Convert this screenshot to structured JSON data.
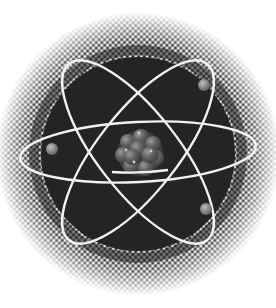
{
  "image": {
    "subject": "Atom illustration",
    "description": "Halftone atom icon with nucleus and three orbiting electrons",
    "colors": {
      "background": "#ffffff",
      "disc": "#242424",
      "halftone_dot": "#1c1c1c",
      "orbit": "#f2f2f2",
      "nucleus_base": "#5a5a5a",
      "nucleus_highlight": "#8a8a8a",
      "electron": "#8c8c8c",
      "electron_highlight": "#bdbdbd"
    },
    "center": [
      138,
      154
    ],
    "disc_radius": 96,
    "halftone_outer_radius": 142,
    "orbits": [
      {
        "name": "orbit-horizontal",
        "rx": 118,
        "ry": 32,
        "rotate": -3
      },
      {
        "name": "orbit-tilted-left",
        "rx": 110,
        "ry": 42,
        "rotate": 52
      },
      {
        "name": "orbit-tilted-right",
        "rx": 110,
        "ry": 42,
        "rotate": -52
      }
    ],
    "electrons": [
      {
        "name": "electron-top-right",
        "cx": 204,
        "cy": 85,
        "r": 6
      },
      {
        "name": "electron-left",
        "cx": 52,
        "cy": 149,
        "r": 6
      },
      {
        "name": "electron-bottom-right",
        "cx": 206,
        "cy": 209,
        "r": 6
      }
    ],
    "nucleus": {
      "cx": 140,
      "cy": 153,
      "r": 23
    }
  }
}
